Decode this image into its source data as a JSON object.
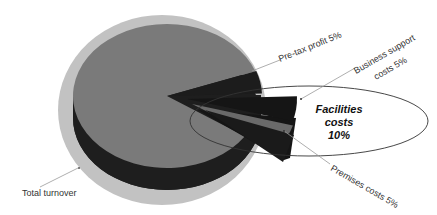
{
  "chart_data": {
    "type": "pie",
    "style": "3d-exploded",
    "title": "",
    "slices": [
      {
        "label": "Total turnover",
        "value": 85,
        "color": "#7a7a7a"
      },
      {
        "label": "Pre-tax profit 5%",
        "value": 5,
        "color": "#1c1c1c"
      },
      {
        "label": "Business support costs 5%",
        "value": 5,
        "color": "#151515"
      },
      {
        "label": "Premises costs 5%",
        "value": 5,
        "color": "#6a6a6a"
      }
    ],
    "annotations": [
      {
        "text_lines": [
          "Facilities",
          "costs",
          "10%"
        ],
        "highlights": [
          "Business support costs 5%",
          "Premises costs 5%"
        ]
      }
    ],
    "labels": {
      "total": "Total turnover",
      "pretax": "Pre-tax profit 5%",
      "business_line1": "Business support",
      "business_line2": "costs 5%",
      "premises": "Premises costs 5%"
    },
    "callout": {
      "line1": "Facilities",
      "line2": "costs",
      "line3": "10%"
    },
    "colors": {
      "halo": "#c2c2c2",
      "top": "#7a7a7a",
      "side": "#1e1e1e",
      "leader": "#999999"
    }
  }
}
